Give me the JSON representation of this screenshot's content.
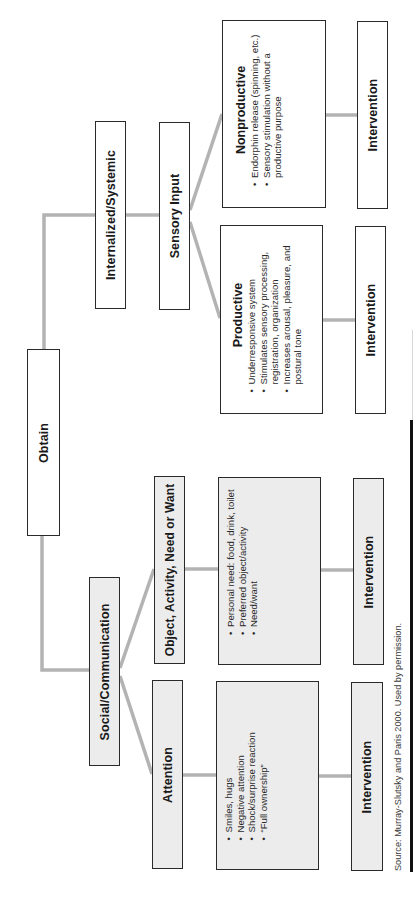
{
  "diagram": {
    "orientation": "rotated 90deg counter-clockwise (reads bottom-to-top)",
    "colors": {
      "connector": "#b3b3b3",
      "box_border": "#2a2a2a",
      "shaded_fill": "#ececec",
      "plain_fill": "#ffffff"
    },
    "root": {
      "label": "Obtain"
    },
    "branches": {
      "internalized": {
        "label": "Internalized/Systemic",
        "child": {
          "label": "Sensory Input",
          "productive": {
            "heading": "Productive",
            "items": [
              "Underresponsive system",
              "Stimulates sensory processing, registration, organization",
              "Increases arousal, pleasure, and postural tone"
            ],
            "intervention": "Intervention"
          },
          "nonproductive": {
            "heading": "Nonproductive",
            "items": [
              "Endorphin release (spinning, etc.)",
              "Sensory stimulation without a productive purpose"
            ],
            "intervention": "Intervention"
          }
        }
      },
      "social": {
        "label": "Social/Communication",
        "attention": {
          "label": "Attention",
          "items": [
            "Smiles, hugs",
            "Negative attention",
            "Shock/surprise reaction",
            "“Full ownership”"
          ],
          "intervention": "Intervention"
        },
        "object": {
          "label": "Object, Activity, Need or Want",
          "items": [
            "Personal need: food, drink, toilet",
            "Preferred object/activity",
            "Need/want"
          ],
          "intervention": "Intervention"
        }
      }
    },
    "source": "Source: Murray-Slutsky and Paris 2000. Used by permission."
  }
}
